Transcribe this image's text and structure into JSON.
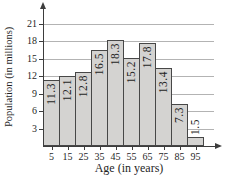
{
  "chart_data": {
    "type": "bar",
    "title": "",
    "xlabel": "Age (in years)",
    "ylabel": "Population (in millions)",
    "categories": [
      "5",
      "15",
      "25",
      "35",
      "45",
      "55",
      "65",
      "75",
      "85",
      "95"
    ],
    "values": [
      11.3,
      12.1,
      12.8,
      16.5,
      18.3,
      15.2,
      17.8,
      13.4,
      7.3,
      1.5
    ],
    "bar_labels": [
      "11.3",
      "12.1",
      "12.8",
      "16.5",
      "18.3",
      "15.2",
      "17.8",
      "13.4",
      "7.3",
      "1.5"
    ],
    "yticks": [
      3,
      6,
      9,
      12,
      15,
      18,
      21
    ],
    "ylim": [
      0,
      22
    ],
    "grid": true,
    "legend": "none",
    "colors": {
      "bar_fill": "#d4d3d1",
      "bar_border": "#474747",
      "grid_line": "#b3b3b3",
      "axis_line": "#3d3d3d",
      "text": "#1f1f1f"
    }
  }
}
